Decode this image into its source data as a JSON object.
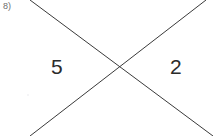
{
  "figure": {
    "problem_label": "8)",
    "background_color": "#ffffff",
    "line_color": "#3a3a3a",
    "label_color": "#2b2b2b",
    "problem_label_color": "#6e6e6e",
    "width": 213,
    "height": 136,
    "intersection": {
      "x": 119,
      "y": 69
    },
    "lines": [
      {
        "name": "line-descending",
        "from": {
          "x": 30,
          "y": 0
        },
        "to": {
          "x": 213,
          "y": 136
        },
        "stroke_width": 1
      },
      {
        "name": "line-ascending",
        "from": {
          "x": 30,
          "y": 136
        },
        "to": {
          "x": 206,
          "y": 0
        },
        "stroke_width": 1
      }
    ],
    "angle_labels": [
      {
        "name": "left-angle",
        "text": "5",
        "x": 57,
        "y": 67
      },
      {
        "name": "right-angle",
        "text": "2",
        "x": 177,
        "y": 67
      }
    ]
  }
}
